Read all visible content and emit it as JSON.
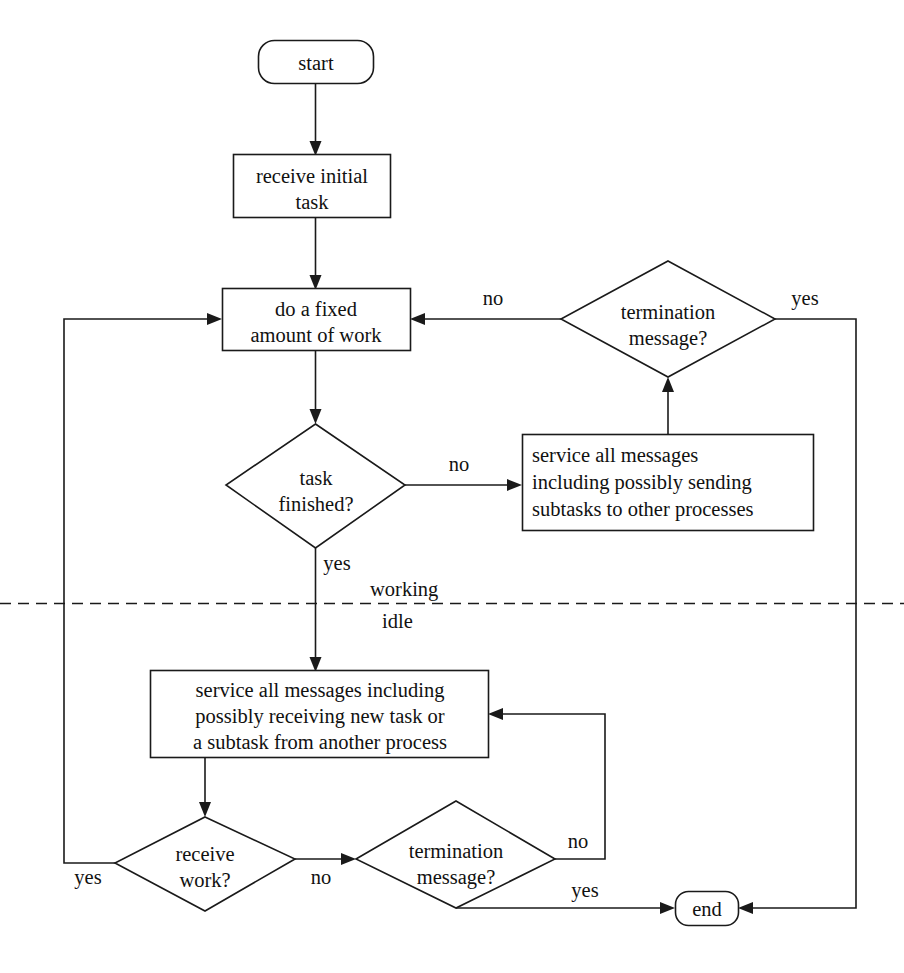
{
  "diagram": {
    "type": "flowchart",
    "colors": {
      "stroke": "#1a1a1a",
      "fill": "#ffffff",
      "text": "#111111",
      "background": "#ffffff"
    },
    "phase_labels": {
      "working": "working",
      "idle": "idle"
    },
    "nodes": {
      "start": {
        "label": "start",
        "shape": "stadium"
      },
      "receive_initial_task": {
        "label_line1": "receive initial",
        "label_line2": "task",
        "shape": "rectangle"
      },
      "do_fixed_work": {
        "label_line1": "do a fixed",
        "label_line2": "amount of work",
        "shape": "rectangle"
      },
      "task_finished": {
        "label_line1": "task",
        "label_line2": "finished?",
        "shape": "diamond"
      },
      "termination_message_top": {
        "label_line1": "termination",
        "label_line2": "message?",
        "shape": "diamond"
      },
      "service_sending": {
        "label_line1": "service all messages",
        "label_line2": "including possibly sending",
        "label_line3": "subtasks to other processes",
        "shape": "rectangle"
      },
      "service_receiving": {
        "label_line1": "service all messages including",
        "label_line2": "possibly receiving new task or",
        "label_line3": "a subtask from another process",
        "shape": "rectangle"
      },
      "receive_work": {
        "label_line1": "receive",
        "label_line2": "work?",
        "shape": "diamond"
      },
      "termination_message_bottom": {
        "label_line1": "termination",
        "label_line2": "message?",
        "shape": "diamond"
      },
      "end": {
        "label": "end",
        "shape": "stadium"
      }
    },
    "edge_labels": {
      "task_finished_no": "no",
      "task_finished_yes": "yes",
      "termination_top_no": "no",
      "termination_top_yes": "yes",
      "receive_work_yes": "yes",
      "receive_work_no": "no",
      "termination_bottom_no": "no",
      "termination_bottom_yes": "yes"
    }
  }
}
